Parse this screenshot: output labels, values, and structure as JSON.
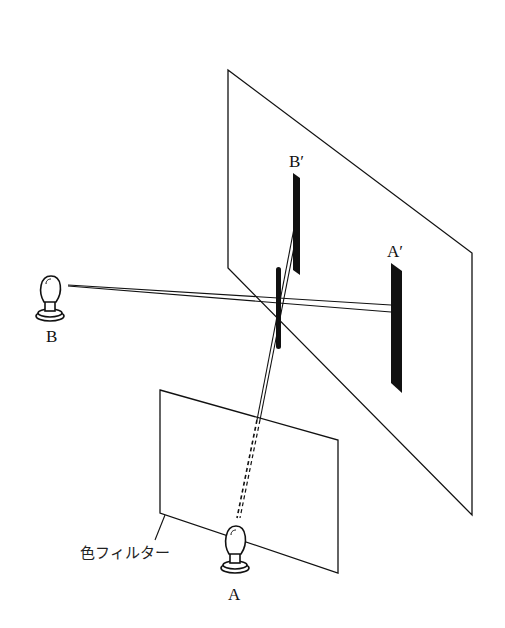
{
  "diagram": {
    "labels": {
      "source_b": "B",
      "source_a": "A",
      "shadow_b": "B′",
      "shadow_a": "A′",
      "filter": "色フィルター"
    },
    "colors": {
      "line": "#111111",
      "shadow": "#111111",
      "background": "#ffffff"
    }
  }
}
